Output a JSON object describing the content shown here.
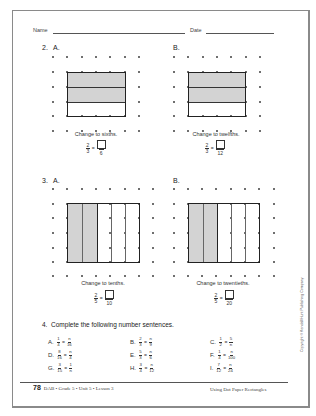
{
  "header": {
    "name_label": "Name",
    "date_label": "Date"
  },
  "problems": {
    "p2": {
      "number": "2.",
      "A": {
        "label": "A.",
        "instruction": "Change to sixths.",
        "fraction": {
          "numerator": "2",
          "denominator": "3"
        },
        "answer_denominator": "6",
        "equals": "="
      },
      "B": {
        "label": "B.",
        "instruction": "Change to twelfths.",
        "fraction": {
          "numerator": "2",
          "denominator": "3"
        },
        "answer_denominator": "12",
        "equals": "="
      }
    },
    "p3": {
      "number": "3.",
      "A": {
        "label": "A.",
        "instruction": "Change to tenths.",
        "fraction": {
          "numerator": "2",
          "denominator": "5"
        },
        "answer_denominator": "10",
        "equals": "="
      },
      "B": {
        "label": "B.",
        "instruction": "Change to twentieths.",
        "fraction": {
          "numerator": "2",
          "denominator": "5"
        },
        "answer_denominator": "20",
        "equals": "="
      }
    },
    "p4": {
      "number": "4.",
      "title": "Complete the following number sentences.",
      "items": [
        {
          "label": "A.",
          "l_num": "1",
          "l_den": "4",
          "r_num": "n",
          "r_den": "16"
        },
        {
          "label": "B.",
          "l_num": "2",
          "l_den": "3",
          "r_num": "n",
          "r_den": "9"
        },
        {
          "label": "C.",
          "l_num": "1",
          "l_den": "2",
          "r_num": "5",
          "r_den": "n"
        },
        {
          "label": "D.",
          "l_num": "8",
          "l_den": "16",
          "r_num": "n",
          "r_den": "4"
        },
        {
          "label": "E.",
          "l_num": "5",
          "l_den": "3",
          "r_num": "n",
          "r_den": "6"
        },
        {
          "label": "F.",
          "l_num": "1",
          "l_den": "4",
          "r_num": "n",
          "r_den": "100"
        },
        {
          "label": "G.",
          "l_num": "3",
          "l_den": "15",
          "r_num": "1",
          "r_den": "n"
        },
        {
          "label": "H.",
          "l_num": "3",
          "l_den": "4",
          "r_num": "n",
          "r_den": "12"
        },
        {
          "label": "I.",
          "l_num": "7",
          "l_den": "12",
          "r_num": "n",
          "r_den": "24"
        }
      ],
      "equals": "="
    }
  },
  "footer": {
    "page_number": "78",
    "course_info": "DAB • Grade 5 • Unit 5 • Lesson 3",
    "lesson_title": "Using Dot Paper Rectangles"
  },
  "copyright": "Copyright © Kendall/Hunt Publishing Company",
  "colors": {
    "shading": "#d3d3d3",
    "border": "#8a8a8a",
    "ink": "#333333"
  }
}
